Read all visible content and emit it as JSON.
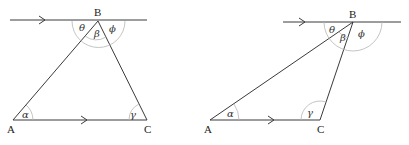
{
  "diagrams": [
    {
      "name": "acute-triangle",
      "vertices": {
        "A": "A",
        "B": "B",
        "C": "C"
      },
      "angles": {
        "theta": "θ",
        "beta": "β",
        "phi": "ϕ",
        "alpha": "α",
        "gamma": "γ"
      }
    },
    {
      "name": "obtuse-triangle",
      "vertices": {
        "A": "A",
        "B": "B",
        "C": "C"
      },
      "angles": {
        "theta": "θ",
        "beta": "β",
        "phi": "ϕ",
        "alpha": "α",
        "gamma": "γ"
      }
    }
  ]
}
